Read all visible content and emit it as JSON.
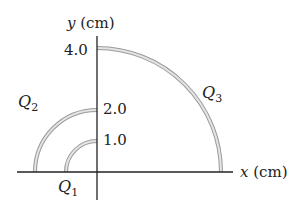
{
  "diagram": {
    "type": "charge-arcs",
    "axes": {
      "x_label_var": "x",
      "x_label_unit": "(cm)",
      "y_label_var": "y",
      "y_label_unit": "(cm)"
    },
    "ticks": [
      {
        "value": "1.0"
      },
      {
        "value": "2.0"
      },
      {
        "value": "4.0"
      }
    ],
    "arcs": [
      {
        "name": "Q",
        "sub": "1",
        "radius_cm": 1.0,
        "quadrant": "second"
      },
      {
        "name": "Q",
        "sub": "2",
        "radius_cm": 2.0,
        "quadrant": "second"
      },
      {
        "name": "Q",
        "sub": "3",
        "radius_cm": 4.0,
        "quadrant": "first"
      }
    ],
    "colors": {
      "axis": "#222222",
      "arc_outer": "#9a9a9a",
      "arc_inner": "#e2e2e2"
    }
  }
}
